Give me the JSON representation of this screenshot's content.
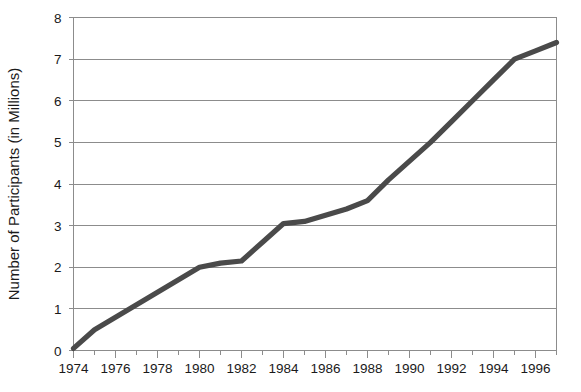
{
  "chart_data": {
    "type": "line",
    "title": "",
    "xlabel": "",
    "ylabel": "Number of Participants (in Millions)",
    "xlim": [
      1974,
      1997
    ],
    "ylim": [
      0,
      8
    ],
    "grid": true,
    "legend": null,
    "line_color": "#4a4a4a",
    "axis_color": "#8c8c8c",
    "x_major_ticks": [
      1974,
      1976,
      1978,
      1980,
      1982,
      1984,
      1986,
      1988,
      1990,
      1992,
      1994,
      1996
    ],
    "x_major_tick_labels": [
      "1974",
      "1976",
      "1978",
      "1980",
      "1982",
      "1984",
      "1986",
      "1988",
      "1990",
      "1992",
      "1994",
      "1996"
    ],
    "x_minor_ticks": [
      1975,
      1977,
      1979,
      1981,
      1983,
      1985,
      1987,
      1989,
      1991,
      1993,
      1995,
      1997
    ],
    "y_ticks": [
      0,
      1,
      2,
      3,
      4,
      5,
      6,
      7,
      8
    ],
    "y_tick_labels": [
      "0",
      "1",
      "2",
      "3",
      "4",
      "5",
      "6",
      "7",
      "8"
    ],
    "x": [
      1974,
      1975,
      1976,
      1977,
      1978,
      1979,
      1980,
      1981,
      1982,
      1983,
      1984,
      1985,
      1986,
      1987,
      1988,
      1989,
      1990,
      1991,
      1992,
      1993,
      1994,
      1995,
      1996,
      1997
    ],
    "values": [
      0.05,
      0.5,
      0.8,
      1.1,
      1.4,
      1.7,
      2.0,
      2.1,
      2.15,
      2.6,
      3.05,
      3.1,
      3.25,
      3.4,
      3.6,
      4.1,
      4.55,
      5.0,
      5.5,
      6.0,
      6.5,
      7.0,
      7.2,
      7.4
    ],
    "series": [
      {
        "name": "Participants",
        "values": [
          0.05,
          0.5,
          0.8,
          1.1,
          1.4,
          1.7,
          2.0,
          2.1,
          2.15,
          2.6,
          3.05,
          3.1,
          3.25,
          3.4,
          3.6,
          4.1,
          4.55,
          5.0,
          5.5,
          6.0,
          6.5,
          7.0,
          7.2,
          7.4
        ]
      }
    ]
  }
}
